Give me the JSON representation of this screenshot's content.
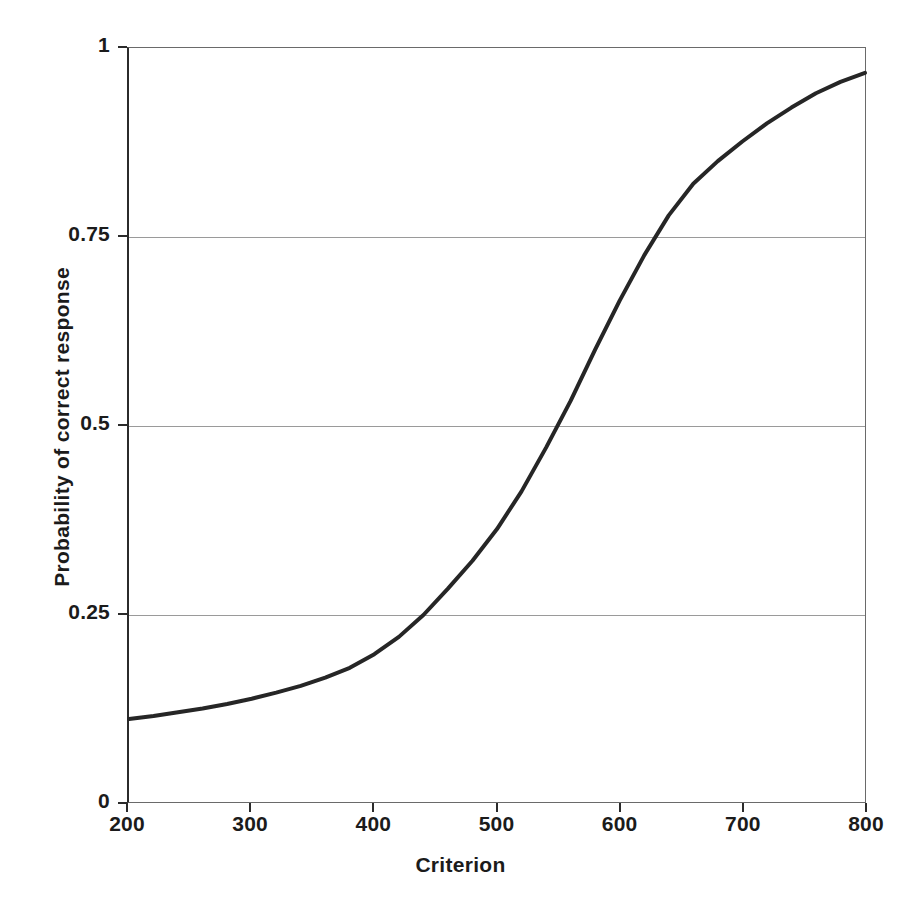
{
  "chart_data": {
    "type": "line",
    "title": "",
    "xlabel": "Criterion",
    "ylabel": "Probability of correct response",
    "xlim": [
      200,
      800
    ],
    "ylim": [
      0,
      1
    ],
    "xticks": [
      "200",
      "300",
      "400",
      "500",
      "600",
      "700",
      "800"
    ],
    "xtick_values": [
      200,
      300,
      400,
      500,
      600,
      700,
      800
    ],
    "yticks": [
      "0",
      "0.25",
      "0.5",
      "0.75",
      "1"
    ],
    "ytick_values": [
      0,
      0.25,
      0.5,
      0.75,
      1
    ],
    "grid": "horizontal",
    "gridline_values": [
      0.25,
      0.5,
      0.75
    ],
    "legend": "none",
    "series": [
      {
        "name": "Probability of correct response",
        "color": "#262626",
        "line_width": 4,
        "x": [
          200,
          220,
          240,
          260,
          280,
          300,
          320,
          340,
          360,
          380,
          400,
          420,
          440,
          460,
          480,
          500,
          520,
          540,
          560,
          580,
          600,
          620,
          640,
          660,
          680,
          700,
          720,
          740,
          760,
          780,
          800
        ],
        "values": [
          0.11,
          0.114,
          0.119,
          0.124,
          0.13,
          0.137,
          0.145,
          0.154,
          0.165,
          0.178,
          0.196,
          0.219,
          0.248,
          0.283,
          0.32,
          0.362,
          0.412,
          0.47,
          0.532,
          0.6,
          0.665,
          0.725,
          0.778,
          0.82,
          0.85,
          0.876,
          0.9,
          0.921,
          0.94,
          0.955,
          0.967
        ]
      }
    ],
    "annotations": {
      "midpoint_criterion": 537,
      "value_at_200": 0.11,
      "value_at_800": 0.967
    }
  },
  "axes": {
    "x_title": "Criterion",
    "y_title": "Probability of correct response"
  }
}
